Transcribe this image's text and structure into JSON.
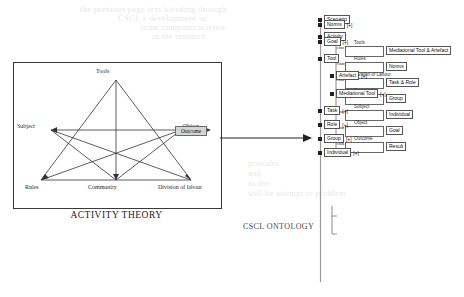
{
  "background_bleed": [
    {
      "text": "the previous page text bleeding through",
      "x": 80,
      "y": 4
    },
    {
      "text": "CSCL  a development in",
      "x": 118,
      "y": 13
    },
    {
      "text": "some computer science",
      "x": 140,
      "y": 22
    },
    {
      "text": "in the research",
      "x": 152,
      "y": 31
    },
    {
      "text": "provides",
      "x": 248,
      "y": 158
    },
    {
      "text": "and",
      "x": 248,
      "y": 168
    },
    {
      "text": "as the",
      "x": 248,
      "y": 178
    },
    {
      "text": "will be attempt to problem",
      "x": 248,
      "y": 188
    }
  ],
  "activity_theory": {
    "caption": "ACTIVITY THEORY",
    "nodes": {
      "tools": "Tools",
      "subject": "Subject",
      "object": "Object",
      "rules": "Rules",
      "community": "Community",
      "division": "Division of labour",
      "outcome": "Outcome"
    }
  },
  "cscl": {
    "caption": "CSCL ONTOLOGY"
  },
  "tree": {
    "root_nodes": [
      {
        "label": "Scenario",
        "expander": "[+]",
        "has_expander": false
      },
      {
        "label": "Activity",
        "expander": "[+]",
        "has_expander": false
      }
    ],
    "activity_children": [
      {
        "relation": "has",
        "slot": "Tools",
        "target": "Mediational Tool & Artefact"
      },
      {
        "relation": "subject to",
        "slot": "Rules",
        "target": "Norms"
      },
      {
        "relation": "has",
        "slot": "Division of Labour",
        "target": "Task & Role"
      },
      {
        "relation": "has",
        "slot": "Community",
        "target": "Group"
      },
      {
        "relation": "has",
        "slot": "Subject",
        "target": "Individual"
      },
      {
        "relation": "has",
        "slot": "Object",
        "target": "Goal"
      },
      {
        "relation": "has",
        "slot": "Outcome",
        "target": "Result"
      }
    ],
    "lower_nodes": [
      {
        "label": "Norms",
        "expander": "[+]",
        "indent": 0
      },
      {
        "label": "Goal",
        "expander": "[+]",
        "indent": 0
      },
      {
        "label": "Tool",
        "expander": "",
        "indent": 0
      },
      {
        "label": "Artefact",
        "expander": "[+]",
        "indent": 1
      },
      {
        "label": "Mediational Tool",
        "expander": "[+]",
        "indent": 1
      },
      {
        "label": "Task",
        "expander": "[+]",
        "indent": 0
      },
      {
        "label": "Role",
        "expander": "[+]",
        "indent": 0
      },
      {
        "label": "Group",
        "expander": "[+]",
        "indent": 0
      },
      {
        "label": "Individual",
        "expander": "[+]",
        "indent": 0
      }
    ]
  }
}
